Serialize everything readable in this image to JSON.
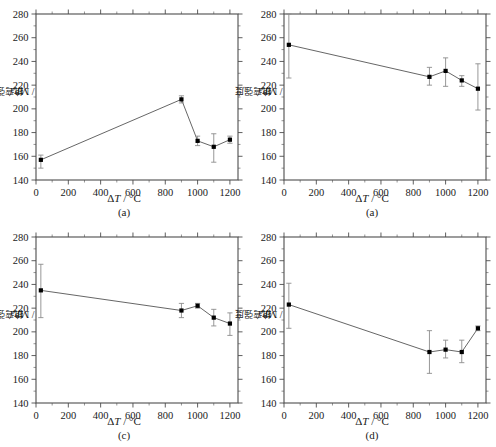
{
  "figure": {
    "layout": "2x2",
    "axis": {
      "xlabel_delta": "Δ",
      "xlabel_t": "T",
      "xlabel_unit": " / °C",
      "ylabel_cjk": "抗弯强度",
      "ylabel_unit": " / MPa",
      "xticks": [
        0,
        200,
        400,
        600,
        800,
        1000,
        1200
      ],
      "yticks": [
        140,
        160,
        180,
        200,
        220,
        240,
        260,
        280
      ],
      "xlim": [
        0,
        1250
      ],
      "ylim": [
        140,
        280
      ],
      "xminor_step": 100,
      "yminor_step": 10,
      "tick_direction": "out",
      "frame": "box"
    },
    "colors": {
      "line": "#555555",
      "marker": "#000000",
      "errorbar": "#8c8c8c",
      "frame": "#4d4d4d",
      "background": "#ffffff"
    },
    "panels": [
      {
        "caption": "(a)",
        "xlabel": "ΔT / °C",
        "ylabel": "抗弯强度 / MPa"
      },
      {
        "caption": "(a)",
        "xlabel": "ΔT / °C",
        "ylabel": "抗弯强度 / MPa"
      },
      {
        "caption": "(c)",
        "xlabel": "ΔT / °C",
        "ylabel": "抗弯强度 / MPa"
      },
      {
        "caption": "(d)",
        "xlabel": "ΔT / °C",
        "ylabel": "抗弯强度 / MPa"
      }
    ]
  },
  "chart_data": [
    {
      "type": "line",
      "panel": "(a)",
      "title": "",
      "xlabel": "ΔT / °C",
      "ylabel": "抗弯强度 / MPa",
      "xlim": [
        0,
        1250
      ],
      "ylim": [
        140,
        280
      ],
      "grid": false,
      "legend": "none",
      "x": [
        30,
        900,
        1000,
        1100,
        1200
      ],
      "values": [
        157,
        208,
        173,
        168,
        174
      ],
      "yerr_lower": [
        7,
        3,
        4,
        13,
        3
      ],
      "yerr_upper": [
        4,
        3,
        4,
        11,
        3
      ]
    },
    {
      "type": "line",
      "panel": "(a)",
      "title": "",
      "xlabel": "ΔT / °C",
      "ylabel": "抗弯强度 / MPa",
      "xlim": [
        0,
        1250
      ],
      "ylim": [
        140,
        280
      ],
      "grid": false,
      "legend": "none",
      "x": [
        30,
        900,
        1000,
        1100,
        1200
      ],
      "values": [
        254,
        227,
        232,
        224,
        217
      ],
      "yerr_lower": [
        28,
        7,
        13,
        5,
        18
      ],
      "yerr_upper": [
        26,
        8,
        11,
        4,
        21
      ]
    },
    {
      "type": "line",
      "panel": "(c)",
      "title": "",
      "xlabel": "ΔT / °C",
      "ylabel": "抗弯强度 / MPa",
      "xlim": [
        0,
        1250
      ],
      "ylim": [
        140,
        280
      ],
      "grid": false,
      "legend": "none",
      "x": [
        30,
        900,
        1000,
        1100,
        1200
      ],
      "values": [
        235,
        218,
        222,
        212,
        207
      ],
      "yerr_lower": [
        23,
        6,
        2,
        7,
        10
      ],
      "yerr_upper": [
        22,
        6,
        2,
        7,
        9
      ]
    },
    {
      "type": "line",
      "panel": "(d)",
      "title": "",
      "xlabel": "ΔT / °C",
      "ylabel": "抗弯强度 / MPa",
      "xlim": [
        0,
        1250
      ],
      "ylim": [
        140,
        280
      ],
      "grid": false,
      "legend": "none",
      "x": [
        30,
        900,
        1000,
        1100,
        1200
      ],
      "values": [
        223,
        183,
        185,
        183,
        203
      ],
      "yerr_lower": [
        20,
        18,
        7,
        9,
        2
      ],
      "yerr_upper": [
        18,
        18,
        8,
        10,
        2
      ]
    }
  ]
}
